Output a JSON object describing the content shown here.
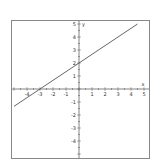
{
  "chart_data": {
    "type": "line",
    "title": "",
    "xlabel": "x",
    "ylabel": "y",
    "xlim": [
      -5,
      5
    ],
    "ylim": [
      -5,
      5
    ],
    "grid": false,
    "x_ticks": [
      "-4",
      "-3",
      "-2",
      "-1",
      "1",
      "2",
      "3",
      "4",
      "5"
    ],
    "y_ticks": [
      "5",
      "4",
      "3",
      "2",
      "1",
      "-1",
      "-2",
      "-3",
      "-4"
    ],
    "series": [
      {
        "name": "y = (2/3)x + 2",
        "x": [
          -5,
          4.5
        ],
        "y": [
          -1.333,
          5
        ],
        "color": "#555555"
      }
    ],
    "annotations": []
  },
  "colors": {
    "frame": "#888888",
    "axis": "#666666",
    "line": "#555555",
    "background": "#ffffff"
  }
}
